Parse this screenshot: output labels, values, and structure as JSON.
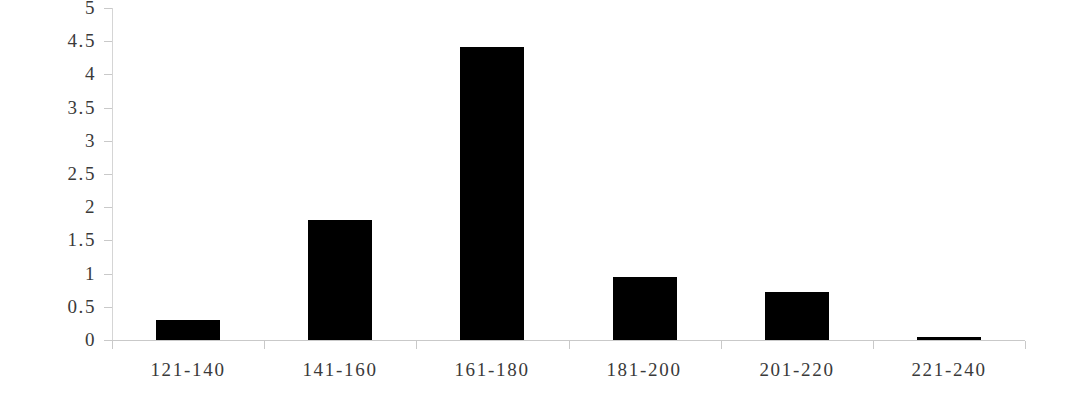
{
  "chart_data": {
    "type": "bar",
    "title": "",
    "subtitle": "",
    "xlabel": "",
    "ylabel": "",
    "categories": [
      "121-140",
      "141-160",
      "161-180",
      "181-200",
      "201-220",
      "221-240"
    ],
    "values": [
      0.3,
      1.81,
      4.42,
      0.95,
      0.72,
      0.04
    ],
    "series": [
      {
        "name": "",
        "values": [
          0.3,
          1.81,
          4.42,
          0.95,
          0.72,
          0.04
        ]
      }
    ],
    "ylim": [
      0,
      5
    ],
    "ytick_labels": [
      "0",
      "0.5",
      "1",
      "1.5",
      "2",
      "2.5",
      "3",
      "3.5",
      "4",
      "4.5",
      "5"
    ],
    "ytick_values": [
      0,
      0.5,
      1,
      1.5,
      2,
      2.5,
      3,
      3.5,
      4,
      4.5,
      5
    ],
    "grid": false,
    "legend": false,
    "legend_position": "none",
    "bar_color": "#000000",
    "axis_color": "#c9c9c9",
    "text_color": "#3a3a3a",
    "background": "#ffffff"
  }
}
